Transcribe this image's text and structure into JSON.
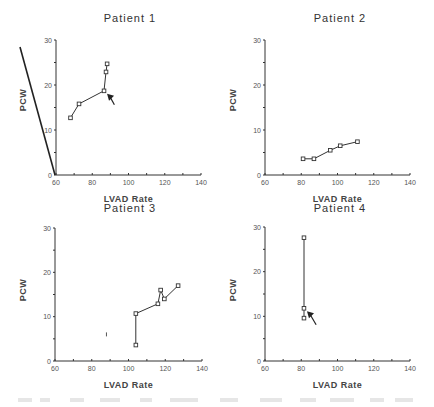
{
  "figure": {
    "caption_visible": "",
    "panels": 4
  },
  "chart_data": [
    {
      "type": "line",
      "title": "Patient  1",
      "xlabel": "LVAD  Rate",
      "ylabel": "PCW",
      "xlim": [
        60,
        140
      ],
      "ylim": [
        0,
        30
      ],
      "xticks": [
        "60",
        "80",
        "100",
        "120",
        "140"
      ],
      "yticks": [
        "0",
        "10",
        "20",
        "30"
      ],
      "grid": false,
      "marker": "square",
      "series": [
        {
          "name": "Patient 1",
          "x": [
            68,
            72.7,
            86.5,
            87.6,
            88.2
          ],
          "y": [
            12.7,
            15.8,
            18.7,
            22.9,
            24.7
          ]
        }
      ],
      "annotations": [
        {
          "type": "arrow",
          "x": 90,
          "y": 16.5,
          "points_to": [
            86.5,
            18.7
          ]
        },
        {
          "type": "line",
          "note": "diagonal stroke left of y-axis"
        }
      ]
    },
    {
      "type": "line",
      "title": "Patient  2",
      "xlabel": "LVAD  Rate",
      "ylabel": "PCW",
      "xlim": [
        60,
        140
      ],
      "ylim": [
        0,
        30
      ],
      "xticks": [
        "60",
        "80",
        "100",
        "120",
        "140"
      ],
      "yticks": [
        "0",
        "10",
        "20",
        "30"
      ],
      "grid": false,
      "marker": "square",
      "series": [
        {
          "name": "Patient 2",
          "x": [
            81,
            87,
            96,
            101.5,
            111
          ],
          "y": [
            3.6,
            3.6,
            5.5,
            6.5,
            7.4
          ]
        }
      ],
      "annotations": []
    },
    {
      "type": "line",
      "title": "Patient  3",
      "xlabel": "LVAD  Rate",
      "ylabel": "PCW",
      "xlim": [
        60,
        140
      ],
      "ylim": [
        0,
        30
      ],
      "xticks": [
        "60",
        "80",
        "100",
        "120",
        "140"
      ],
      "yticks": [
        "0",
        "10",
        "20",
        "30"
      ],
      "grid": false,
      "marker": "square",
      "series": [
        {
          "name": "Patient 3",
          "x": [
            104,
            104,
            116,
            117.5,
            119.5,
            127
          ],
          "y": [
            3.6,
            10.7,
            12.9,
            16,
            14,
            17
          ]
        }
      ],
      "annotations": [
        {
          "type": "mark",
          "x": 88,
          "y": 6
        }
      ]
    },
    {
      "type": "line",
      "title": "Patient  4",
      "xlabel": "LVAD  Rate",
      "ylabel": "PCW",
      "xlim": [
        60,
        140
      ],
      "ylim": [
        0,
        30
      ],
      "xticks": [
        "60",
        "80",
        "100",
        "120",
        "140"
      ],
      "yticks": [
        "0",
        "10",
        "20",
        "30"
      ],
      "grid": false,
      "marker": "square",
      "series": [
        {
          "name": "Patient 4",
          "x": [
            81.5,
            81.5,
            81.5
          ],
          "y": [
            27.6,
            11.8,
            9.6
          ]
        }
      ],
      "annotations": [
        {
          "type": "arrow",
          "x": 86,
          "y": 9,
          "points_to": [
            81.5,
            11.8
          ]
        }
      ]
    }
  ],
  "layout": {
    "panels": [
      {
        "ox": 56,
        "oy": 175,
        "x140": 201,
        "y30": 40,
        "title_x": 130,
        "title_y": 22,
        "ylabel_x": 26,
        "ylabel_y": 100,
        "xlabel_y": 202
      },
      {
        "ox": 265,
        "oy": 175,
        "x140": 410,
        "y30": 40,
        "title_x": 340,
        "title_y": 22,
        "ylabel_x": 236,
        "ylabel_y": 100,
        "xlabel_y": 202
      },
      {
        "ox": 55,
        "oy": 361,
        "x140": 202,
        "y30": 228,
        "title_x": 130,
        "title_y": 212,
        "ylabel_x": 26,
        "ylabel_y": 290,
        "xlabel_y": 388
      },
      {
        "ox": 265,
        "oy": 361,
        "x140": 410,
        "y30": 227,
        "title_x": 340,
        "title_y": 212,
        "ylabel_x": 236,
        "ylabel_y": 290,
        "xlabel_y": 388
      }
    ]
  }
}
